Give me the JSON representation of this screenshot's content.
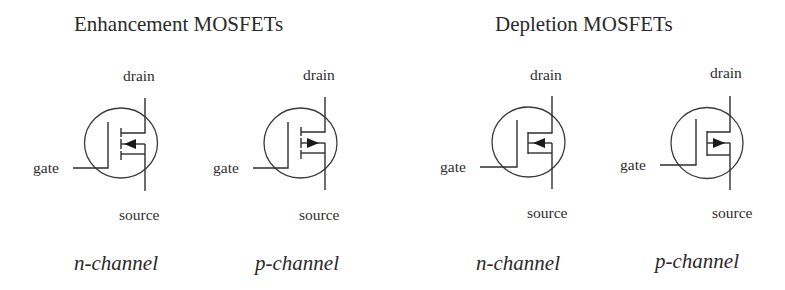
{
  "titles": {
    "enhancement": "Enhancement MOSFETs",
    "depletion": "Depletion MOSFETs"
  },
  "terminals": {
    "drain": "drain",
    "source": "source",
    "gate": "gate"
  },
  "symbols": [
    {
      "group": "enhancement",
      "type": "n-channel",
      "label": "n-channel",
      "channel": "broken",
      "arrow_direction": "inward",
      "drain_label": "drain",
      "source_label": "source",
      "gate_label": "gate"
    },
    {
      "group": "enhancement",
      "type": "p-channel",
      "label": "p-channel",
      "channel": "broken",
      "arrow_direction": "outward",
      "drain_label": "drain",
      "source_label": "source",
      "gate_label": "gate"
    },
    {
      "group": "depletion",
      "type": "n-channel",
      "label": "n-channel",
      "channel": "solid",
      "arrow_direction": "inward",
      "drain_label": "drain",
      "source_label": "source",
      "gate_label": "gate"
    },
    {
      "group": "depletion",
      "type": "p-channel",
      "label": "p-channel",
      "channel": "solid",
      "arrow_direction": "outward",
      "drain_label": "drain",
      "source_label": "source",
      "gate_label": "gate"
    }
  ],
  "colors": {
    "background": "#ffffff",
    "ink": "#2e2e2e"
  }
}
